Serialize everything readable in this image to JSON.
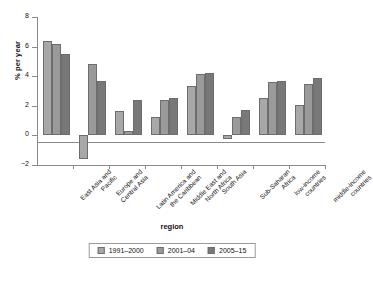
{
  "chart_data": {
    "type": "bar",
    "title": "",
    "xlabel": "region",
    "ylabel": "% per year",
    "ylim": [
      -2,
      8
    ],
    "yticks": [
      -2,
      0,
      2,
      4,
      6,
      8
    ],
    "ytick_labels": [
      "−2",
      "0",
      "2",
      "4",
      "6",
      "8"
    ],
    "grid": false,
    "legend_position": "bottom",
    "categories": [
      "East Asia and Pacific",
      "Europe and Central Asia",
      "Latin America and the Caribbean",
      "Middle East and North Africa",
      "South Asia",
      "Sub-Saharan Africa",
      "low-income countries",
      "middle-income countries"
    ],
    "category_lines": [
      [
        "East Asia and",
        "Pacific"
      ],
      [
        "Europe and",
        "Central Asia"
      ],
      [
        "Latin America and",
        "the Caribbean"
      ],
      [
        "Middle East and",
        "North Africa"
      ],
      [
        "South Asia"
      ],
      [
        "Sub-Saharan",
        "Africa"
      ],
      [
        "low-income",
        "countries"
      ],
      [
        "middle-income",
        "countries"
      ]
    ],
    "series": [
      {
        "name": "1991–2000",
        "color": "#a8a8a8",
        "values": [
          6.4,
          -1.6,
          1.65,
          1.25,
          3.35,
          -0.25,
          2.5,
          2.05
        ]
      },
      {
        "name": "2001–04",
        "color": "#9a9a9a",
        "values": [
          6.2,
          4.85,
          0.3,
          2.4,
          4.15,
          1.25,
          3.6,
          3.5
        ]
      },
      {
        "name": "2005–15",
        "color": "#787878",
        "values": [
          5.5,
          3.65,
          2.4,
          2.5,
          4.2,
          1.7,
          3.65,
          3.9
        ]
      }
    ]
  },
  "legend": {
    "items": [
      {
        "label": "1991–2000",
        "color": "#a8a8a8"
      },
      {
        "label": "2001–04",
        "color": "#9a9a9a"
      },
      {
        "label": "2005–15",
        "color": "#787878"
      }
    ]
  },
  "colors": {
    "axis": "#8a8a8a",
    "text": "#111111",
    "background": "#ffffff",
    "bar_border": "#6d6d6d"
  }
}
